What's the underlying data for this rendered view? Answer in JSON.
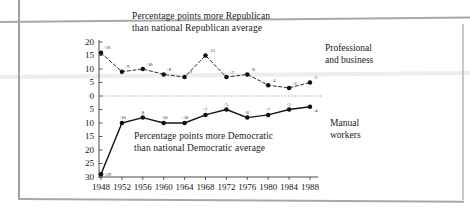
{
  "figure": {
    "caption_top_line1": "Percentage points more Republican",
    "caption_top_line2": "than national Republican average",
    "caption_bottom_line1": "Percentage points more Democratic",
    "caption_bottom_line2": "than national Democratic average",
    "series_label_upper_line1": "Professional",
    "series_label_upper_line2": "and business",
    "series_label_lower_line1": "Manual",
    "series_label_lower_line2": "workers"
  },
  "colors": {
    "ink": "#161616",
    "marker": "#101010",
    "zero_line": "#8a8a8a",
    "axis": "#333333",
    "page_edge": "#a8a8a8"
  },
  "chart_data": {
    "type": "line",
    "title": "Percentage points more Republican than national Republican average",
    "subtitle": "Percentage points more Democratic than national Democratic average",
    "xlabel": "",
    "ylabel": "",
    "x": [
      1948,
      1952,
      1956,
      1960,
      1964,
      1968,
      1972,
      1976,
      1980,
      1984,
      1988
    ],
    "categories": [
      "1948",
      "1952",
      "1956",
      "1960",
      "1964",
      "1968",
      "1972",
      "1976",
      "1980",
      "1984",
      "1988"
    ],
    "yticks": [
      20,
      15,
      10,
      5,
      0,
      5,
      10,
      15,
      20,
      25,
      30
    ],
    "ytick_labels": [
      "20",
      "15",
      "10",
      "5",
      "0",
      "5",
      "10",
      "15",
      "20",
      "25",
      "30"
    ],
    "ylim": [
      -30,
      20
    ],
    "grid": false,
    "zero_line": true,
    "legend_position": "right-inline",
    "series": [
      {
        "name": "Professional and business",
        "style": "dashed",
        "values": [
          16,
          9,
          10,
          8,
          7,
          15,
          7,
          8,
          4,
          3,
          5
        ],
        "point_labels": [
          "+16",
          "+9",
          "+10",
          "+8",
          "+7",
          "+15",
          "+7",
          "+8",
          "+4",
          "+3",
          "+5"
        ]
      },
      {
        "name": "Manual workers",
        "style": "solid",
        "values": [
          -29,
          -10,
          -8,
          -10,
          -10,
          -7,
          -5,
          -8,
          -7,
          -5,
          -4
        ],
        "point_labels": [
          "+29",
          "+10",
          "+8",
          "+10",
          "+10",
          "+7",
          "+5",
          "+8",
          "+7",
          "+5",
          "+4"
        ]
      }
    ]
  }
}
